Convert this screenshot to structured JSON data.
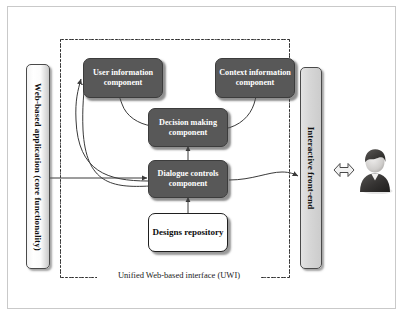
{
  "diagram": {
    "colors": {
      "dark_box_fill": "#585858",
      "dark_box_text": "#ffffff",
      "repository_fill": "#ffffff",
      "left_panel_fill": "#f6f6f6",
      "right_panel_fill": "#d6d6d6",
      "connector": "#3a3a3a",
      "frame_border": "#c9c9c9",
      "uwi_border": "#2b2b2b"
    },
    "left_panel": {
      "label": "Web-based application (core functionality)",
      "icon": "panel-vertical-icon"
    },
    "right_panel": {
      "label": "Interactive front-end",
      "icon": "panel-vertical-icon"
    },
    "uwi": {
      "label": "Unified Web-based interface (UWI)",
      "border_style": "dash-dot"
    },
    "components": [
      {
        "id": "user-information-component",
        "label": "User information component",
        "lines": [
          "User",
          "information",
          "component"
        ],
        "style": "dark"
      },
      {
        "id": "context-information-component",
        "label": "Context information component",
        "lines": [
          "Context",
          "information",
          "component"
        ],
        "style": "dark"
      },
      {
        "id": "decision-making-component",
        "label": "Decision making component",
        "lines": [
          "Decision",
          "making",
          "component"
        ],
        "style": "dark"
      },
      {
        "id": "dialogue-controls-component",
        "label": "Dialogue controls component",
        "lines": [
          "Dialogue",
          "controls",
          "component"
        ],
        "style": "dark"
      },
      {
        "id": "designs-repository",
        "label": "Designs repository",
        "lines": [
          "Designs",
          "repository"
        ],
        "style": "light"
      }
    ],
    "actor": {
      "label": "user-avatar",
      "icon": "person-icon",
      "exchange_icon": "double-headed-arrow-icon"
    },
    "connections": [
      {
        "from": "web-based-application",
        "to": "dialogue-controls-component",
        "type": "arrow"
      },
      {
        "from": "dialogue-controls-component",
        "to": "user-information-component",
        "type": "curved-arrow"
      },
      {
        "from": "dialogue-controls-component",
        "to": "decision-making-component",
        "type": "arrow"
      },
      {
        "from": "dialogue-controls-component",
        "to": "interactive-front-end",
        "type": "curved-arrow"
      },
      {
        "from": "decision-making-component",
        "to": "user-information-component",
        "type": "curved-arrow"
      },
      {
        "from": "decision-making-component",
        "to": "context-information-component",
        "type": "curved-arrow"
      },
      {
        "from": "designs-repository",
        "to": "dialogue-controls-component",
        "type": "arrow"
      },
      {
        "from": "interactive-front-end",
        "to": "user-avatar",
        "type": "double-headed-arrow"
      }
    ]
  }
}
